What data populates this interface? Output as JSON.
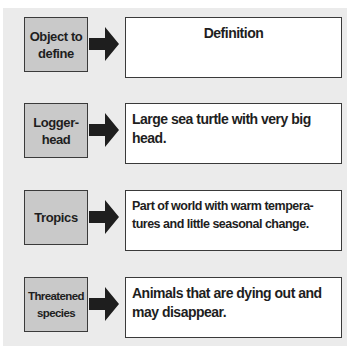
{
  "diagram": {
    "type": "vocabulary-definition-chart",
    "colors": {
      "panel_background": "#ebebeb",
      "term_box_fill": "#c9c9c9",
      "definition_box_fill": "#ffffff",
      "border": "#3a3a3a",
      "arrow": "#1e1e1e"
    },
    "header_row": {
      "term": "Object to\ndefine",
      "definition": "Definition",
      "arrow_icon": "right-arrow-icon"
    },
    "rows": [
      {
        "term": "Logger-\nhead",
        "definition": "Large sea turtle with very big\nhead.",
        "arrow_icon": "right-arrow-icon"
      },
      {
        "term": "Tropics",
        "definition": "Part of world with warm tempera-\ntures and little seasonal change.",
        "arrow_icon": "right-arrow-icon"
      },
      {
        "term": "Threatened\nspecies",
        "definition": "Animals that are dying out and\nmay disappear.",
        "arrow_icon": "right-arrow-icon"
      }
    ]
  }
}
